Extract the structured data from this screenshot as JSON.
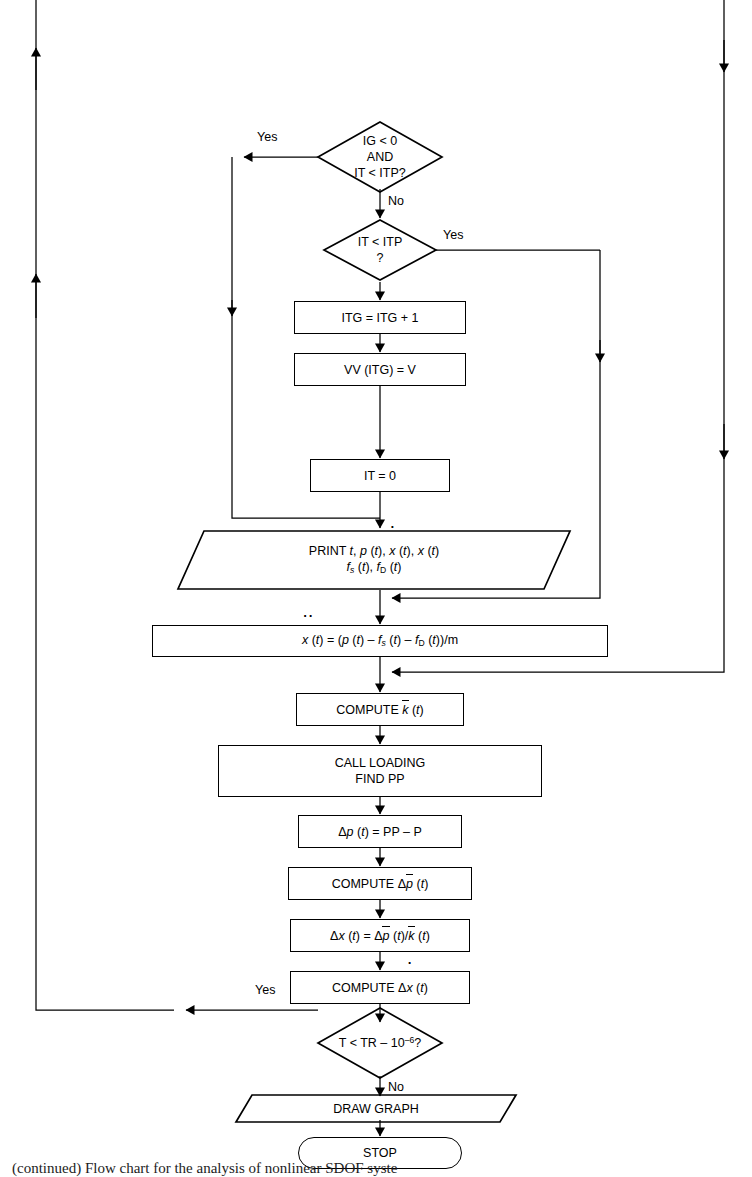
{
  "diagram": {
    "type": "flowchart",
    "title_caption": "(continued) Flow chart for the analysis of nonlinear SDOF syste",
    "line_color": "#000000",
    "background": "#ffffff"
  },
  "nodes": {
    "dec_ig": {
      "shape": "decision",
      "line1": "IG < 0",
      "line2": "AND",
      "line3": "IT < ITP?",
      "yes_label": "Yes",
      "no_label": "No"
    },
    "dec_it": {
      "shape": "decision",
      "line1": "IT < ITP",
      "line2": "?",
      "yes_label": "Yes"
    },
    "proc_itg": {
      "shape": "process",
      "text": "ITG = ITG + 1"
    },
    "proc_vv": {
      "shape": "process",
      "text": "VV (ITG) = V"
    },
    "proc_it0": {
      "shape": "process",
      "text": "IT = 0"
    },
    "io_print": {
      "shape": "io",
      "line1_prefix": "PRINT ",
      "line1_a": "t",
      "line1_b": "p",
      "line1_c": "x",
      "line1_d": "x",
      "line1_t": "(t)",
      "line2_fs": "f",
      "line2_fs_sub": "s",
      "line2_fd": "f",
      "line2_fd_sub": "D",
      "full_text": "PRINT t, p (t), ẋ (t), x (t)  f s (t), f D (t)"
    },
    "proc_accel": {
      "shape": "process",
      "full_text": "ẍ (t) = (p (t) – f s (t) – f D (t))/m"
    },
    "proc_kbar": {
      "shape": "process",
      "prefix": "COMPUTE ",
      "sym": "k",
      "suffix": " (t)",
      "full_text": "COMPUTE k̄ (t)"
    },
    "proc_call": {
      "shape": "process",
      "line1": "CALL LOADING",
      "line2": "FIND PP"
    },
    "proc_dp": {
      "shape": "process",
      "full_text": "Δp (t) = PP – P"
    },
    "proc_dpbar": {
      "shape": "process",
      "prefix": "COMPUTE ",
      "full_text": "COMPUTE Δp̄ (t)"
    },
    "proc_dx": {
      "shape": "process",
      "full_text": "Δx (t) = Δp̄ (t)/k̄ (t)"
    },
    "proc_dxdot": {
      "shape": "process",
      "prefix": "COMPUTE ",
      "full_text": "COMPUTE Δẋ (t)"
    },
    "dec_tr": {
      "shape": "decision",
      "text_prefix": "T < TR – 10",
      "text_exp": "–6",
      "text_suffix": "?",
      "yes_label": "Yes",
      "no_label": "No"
    },
    "io_draw": {
      "shape": "io",
      "text": "DRAW GRAPH"
    },
    "term_stop": {
      "shape": "terminator",
      "text": "STOP"
    }
  },
  "edge_labels": {
    "ig_yes": "Yes",
    "ig_no": "No",
    "it_yes": "Yes",
    "tr_yes": "Yes",
    "tr_no": "No"
  }
}
